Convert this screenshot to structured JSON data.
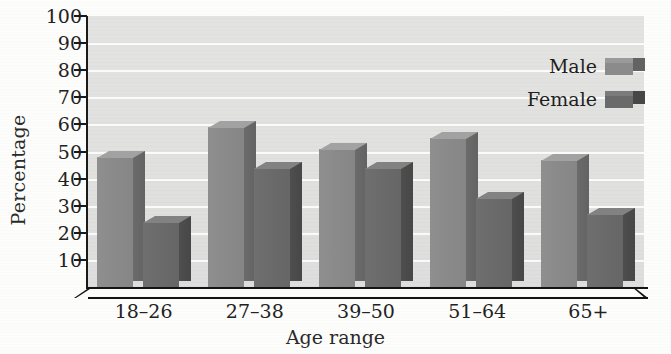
{
  "chart_data": {
    "type": "bar",
    "title": "",
    "xlabel": "Age range",
    "ylabel": "Percentage",
    "ylim": [
      0,
      100
    ],
    "ytick_step": 10,
    "yticks": [
      100,
      90,
      80,
      70,
      60,
      50,
      40,
      30,
      20,
      10
    ],
    "grid": true,
    "legend_position": "top-right",
    "categories": [
      "18–26",
      "27–38",
      "39–50",
      "51–64",
      "65+"
    ],
    "series": [
      {
        "name": "Male",
        "color": "#8b8b8b",
        "values": [
          48,
          59,
          51,
          55,
          47
        ]
      },
      {
        "name": "Female",
        "color": "#6a6a6a",
        "values": [
          24,
          44,
          44,
          33,
          27
        ]
      }
    ],
    "style": "3d-bar-grayscale",
    "plot_background": "#e1e1df",
    "gridline_color": "#ffffff",
    "axis_color": "#1a1a1a"
  },
  "legend": {
    "items": [
      {
        "label": "Male",
        "swatch": "male-swatch"
      },
      {
        "label": "Female",
        "swatch": "female-swatch"
      }
    ]
  },
  "axes": {
    "y_title": "Percentage",
    "x_title": "Age range"
  }
}
